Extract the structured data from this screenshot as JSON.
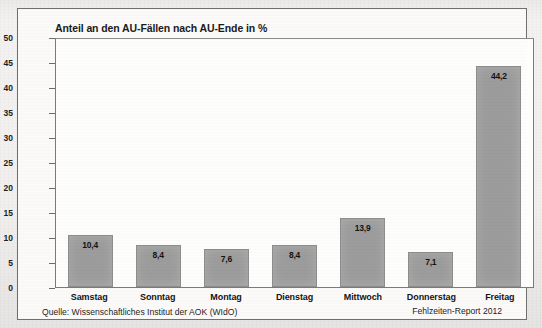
{
  "figure": {
    "title": "Anteil an den AU-Fällen nach AU-Ende in %",
    "source_note": "Quelle: Wissenschaftliches Institut der AOK (WIdO)",
    "report_note": "Fehlzeiten-Report 2012",
    "bar_color": "#9c9c9c",
    "frame_color": "#6f6f6f",
    "text_color": "#141414"
  },
  "chart_data": {
    "type": "bar",
    "title": "Anteil an den AU-Fällen nach AU-Ende in %",
    "xlabel": "",
    "ylabel": "",
    "ylim": [
      0,
      50
    ],
    "yticks": [
      50,
      45,
      40,
      35,
      30,
      25,
      20,
      15,
      10,
      5,
      0
    ],
    "ytick_labels": [
      "50",
      "45",
      "40",
      "35",
      "30",
      "25",
      "20",
      "15",
      "10",
      "5",
      "0"
    ],
    "grid": false,
    "legend": false,
    "categories": [
      "Samstag",
      "Sonntag",
      "Montag",
      "Dienstag",
      "Mittwoch",
      "Donnerstag",
      "Freitag"
    ],
    "values": [
      10.4,
      8.4,
      7.6,
      8.4,
      13.9,
      7.1,
      44.2
    ],
    "value_labels": [
      "10,4",
      "8,4",
      "7,6",
      "8,4",
      "13,9",
      "7,1",
      "44,2"
    ]
  }
}
